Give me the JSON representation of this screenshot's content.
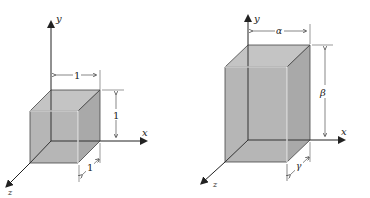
{
  "figures": [
    {
      "name": "unit-cube",
      "axes": {
        "x": "x",
        "y": "y",
        "z": "z"
      },
      "dimensions": {
        "width": "1",
        "height": "1",
        "depth": "1"
      }
    },
    {
      "name": "scaled-box",
      "axes": {
        "x": "x",
        "y": "y",
        "z": "z"
      },
      "dimensions": {
        "width": "α",
        "height": "β",
        "depth": "γ"
      }
    }
  ],
  "colors": {
    "face": "#b4b4b4",
    "edge": "#333333",
    "highlight": "#ffffff"
  }
}
